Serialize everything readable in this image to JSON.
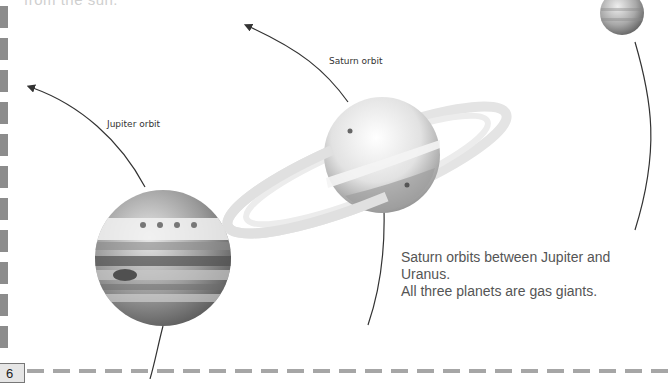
{
  "page": {
    "top_text_partial": "from the sun.",
    "page_number": "6"
  },
  "labels": {
    "jupiter_orbit": "Jupiter orbit",
    "saturn_orbit": "Saturn orbit"
  },
  "caption": {
    "line1": "Saturn orbits between Jupiter and Uranus.",
    "line2": "All three planets are gas giants."
  },
  "planets": [
    {
      "name": "Jupiter",
      "icon": "jupiter-illustration"
    },
    {
      "name": "Saturn",
      "icon": "saturn-illustration"
    },
    {
      "name": "Uranus",
      "icon": "uranus-illustration"
    }
  ],
  "colors": {
    "orbit_line": "#333333",
    "dash_border": "#8c8c8c",
    "caption_text": "#555555"
  }
}
